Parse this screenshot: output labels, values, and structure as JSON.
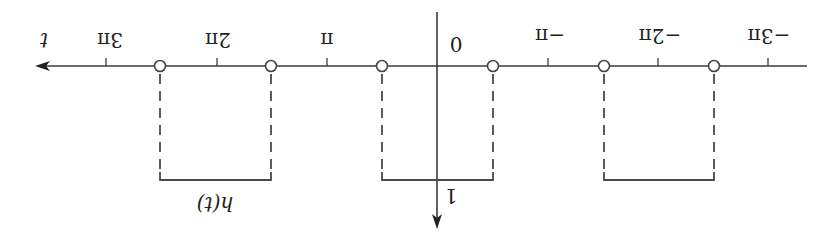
{
  "diagram": {
    "orientation": "rotated 180 degrees",
    "function_label": "h(t)",
    "axis": {
      "horizontal_label": "t",
      "origin_label": "0",
      "vertical_value_label": "1"
    },
    "ticks": [
      {
        "label": "3π",
        "x": 106
      },
      {
        "label": "2π",
        "x": 217
      },
      {
        "label": "π",
        "x": 327
      },
      {
        "label": "−π",
        "x": 548
      },
      {
        "label": "−2π",
        "x": 658
      },
      {
        "label": "−3π",
        "x": 768
      }
    ],
    "open_points_x": [
      160,
      271,
      382,
      493,
      604,
      714
    ],
    "pulses": [
      {
        "x1": 160,
        "x2": 271,
        "height": 1
      },
      {
        "x1": 382,
        "x2": 493,
        "height": 1
      },
      {
        "x1": 604,
        "x2": 714,
        "height": 1
      }
    ],
    "colors": {
      "line": "#3a3a3a",
      "text": "#222222",
      "background": "#ffffff"
    }
  }
}
